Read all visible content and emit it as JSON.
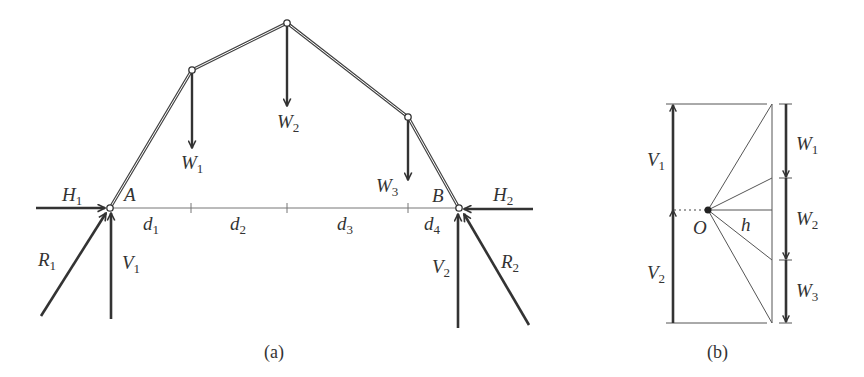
{
  "figure": {
    "panel_a": {
      "caption": "(a)",
      "supports": [
        {
          "label": "A",
          "x": 110,
          "y": 208
        },
        {
          "label": "B",
          "x": 459,
          "y": 208
        }
      ],
      "nodes": [
        {
          "x": 192,
          "y": 70
        },
        {
          "x": 287,
          "y": 23
        },
        {
          "x": 408,
          "y": 117
        }
      ],
      "loads": [
        {
          "name": "W",
          "sub": "1"
        },
        {
          "name": "W",
          "sub": "2"
        },
        {
          "name": "W",
          "sub": "3"
        }
      ],
      "reactions": {
        "H1": {
          "name": "H",
          "sub": "1"
        },
        "H2": {
          "name": "H",
          "sub": "2"
        },
        "V1": {
          "name": "V",
          "sub": "1"
        },
        "V2": {
          "name": "V",
          "sub": "2"
        },
        "R1": {
          "name": "R",
          "sub": "1"
        },
        "R2": {
          "name": "R",
          "sub": "2"
        }
      },
      "spans": [
        {
          "name": "d",
          "sub": "1"
        },
        {
          "name": "d",
          "sub": "2"
        },
        {
          "name": "d",
          "sub": "3"
        },
        {
          "name": "d",
          "sub": "4"
        }
      ]
    },
    "panel_b": {
      "caption": "(b)",
      "pole": "O",
      "pole_distance": "h",
      "left_forces": [
        {
          "name": "V",
          "sub": "1"
        },
        {
          "name": "V",
          "sub": "2"
        }
      ],
      "right_forces": [
        {
          "name": "W",
          "sub": "1"
        },
        {
          "name": "W",
          "sub": "2"
        },
        {
          "name": "W",
          "sub": "3"
        }
      ]
    },
    "colors": {
      "ink": "#333333",
      "thin": "#555555",
      "background": "#ffffff"
    }
  }
}
